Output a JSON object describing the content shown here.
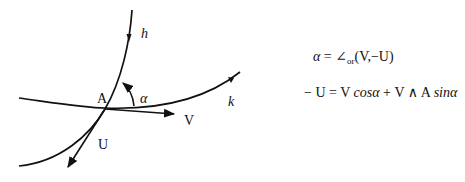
{
  "diagram": {
    "curves": [
      {
        "id": "h",
        "label": "h",
        "role": "curve through A with downward arrow"
      },
      {
        "id": "k",
        "label": "k",
        "role": "curve through A with rightward arrow"
      }
    ],
    "point": {
      "label": "A"
    },
    "vectors": [
      {
        "label": "V",
        "direction": "tangent to k at A, pointing right"
      },
      {
        "label": "U",
        "direction": "tangent to h at A, pointing down-left"
      }
    ],
    "angle": {
      "label": "α",
      "from": "V",
      "to": "-U"
    },
    "colors": {
      "stroke": "#111111",
      "background": "#ffffff"
    }
  },
  "labels": {
    "h": "h",
    "k": "k",
    "A": "A",
    "V": "V",
    "U": "U",
    "alpha": "α"
  },
  "formulas": {
    "f1": {
      "lhs": "α",
      "eq": " = ∠",
      "sub": "or",
      "rhs": "(V,−U)"
    },
    "f2": {
      "lhs": "− U = V ",
      "cos": "cos",
      "alpha1": "α",
      "mid": " + V ∧ A ",
      "sin": "sin",
      "alpha2": "α"
    }
  }
}
